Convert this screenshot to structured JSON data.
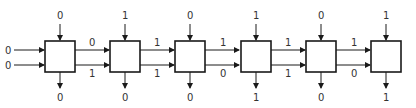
{
  "diagram": {
    "cells": [
      {
        "top_in": "0",
        "bottom_out": "0"
      },
      {
        "top_in": "1",
        "bottom_out": "0"
      },
      {
        "top_in": "0",
        "bottom_out": "0"
      },
      {
        "top_in": "1",
        "bottom_out": "1"
      },
      {
        "top_in": "0",
        "bottom_out": "0"
      },
      {
        "top_in": "1",
        "bottom_out": "1"
      }
    ],
    "left_inputs": {
      "upper": "0",
      "lower": "0"
    },
    "links": [
      {
        "upper": "0",
        "lower": "1"
      },
      {
        "upper": "1",
        "lower": "1"
      },
      {
        "upper": "1",
        "lower": "0"
      },
      {
        "upper": "1",
        "lower": "1"
      },
      {
        "upper": "1",
        "lower": "0"
      }
    ],
    "colors": {
      "line": "#1a1a1a",
      "text": "#333333",
      "background": "#ffffff"
    }
  }
}
